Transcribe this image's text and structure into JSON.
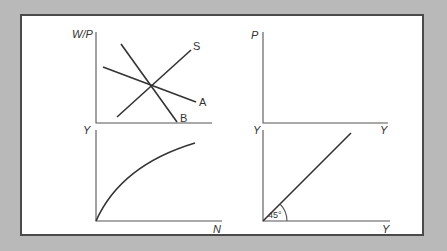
{
  "diagram": {
    "background_color": "#b9b9b9",
    "panel_color": "#ffffff",
    "panels": {
      "labor_market": {
        "y_axis_label": "W/P",
        "curves": [
          {
            "label": "S",
            "kind": "upward-sloping line"
          },
          {
            "label": "A",
            "kind": "downward-sloping line (flatter)"
          },
          {
            "label": "B",
            "kind": "downward-sloping line (steeper)"
          }
        ]
      },
      "price_output": {
        "y_axis_label": "P",
        "x_axis_label": "Y"
      },
      "production_function": {
        "y_axis_label": "Y",
        "x_axis_label": "N",
        "curve": "concave production function from origin"
      },
      "forty_five_degree": {
        "y_axis_label": "Y",
        "x_axis_label": "Y",
        "angle_label": "45°",
        "curve": "45-degree line from origin"
      }
    }
  }
}
